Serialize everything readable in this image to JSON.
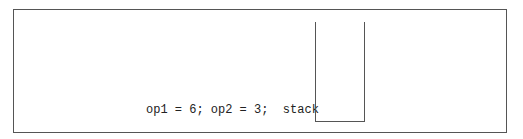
{
  "diagram": {
    "statement": "op1 = 6; op2 = 3;",
    "stack_label": "stack",
    "stack_contents": []
  }
}
